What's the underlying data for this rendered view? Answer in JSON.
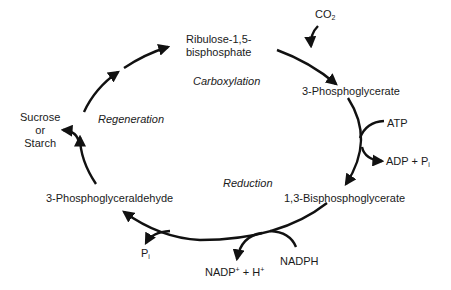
{
  "diagram": {
    "nodes": {
      "rubp": {
        "line1": "Ribulose-1,5-",
        "line2": "bisphosphate"
      },
      "pga": "3-Phosphoglycerate",
      "bpg": "1,3-Bisphosphoglycerate",
      "g3p": "3-Phosphoglyceraldehyde",
      "sucrose": {
        "line1": "Sucrose",
        "line2": "or",
        "line3": "Starch"
      }
    },
    "phases": {
      "carboxylation": "Carboxylation",
      "reduction": "Reduction",
      "regeneration": "Regeneration"
    },
    "inputs_outputs": {
      "co2": {
        "base": "CO",
        "sub": "2"
      },
      "atp": "ATP",
      "adp_pi": {
        "base": "ADP + P",
        "sub": "i"
      },
      "nadph": "NADPH",
      "nadp": {
        "a": "NADP",
        "sup1": "+",
        "b": " + H",
        "sup2": "+"
      },
      "pi": {
        "base": "P",
        "sub": "i"
      }
    },
    "colors": {
      "stroke": "#111111",
      "text": "#1a1a1a",
      "background": "#ffffff"
    }
  }
}
